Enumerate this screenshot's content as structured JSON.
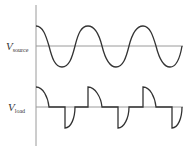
{
  "diagram": {
    "labels": {
      "source_main": "V",
      "source_sub": "source",
      "load_main": "V",
      "load_sub": "load"
    },
    "colors": {
      "axis": "#9a9a9a",
      "baseline": "#9a9a9a",
      "waveform": "#333333"
    },
    "waveforms": [
      {
        "name": "source",
        "shape": "sinusoid (cosine)",
        "cycles": 2.75
      },
      {
        "name": "load",
        "shape": "clipped/chopped pulses: positive decaying quarter-arcs and negative delayed quarter-arcs"
      }
    ]
  }
}
